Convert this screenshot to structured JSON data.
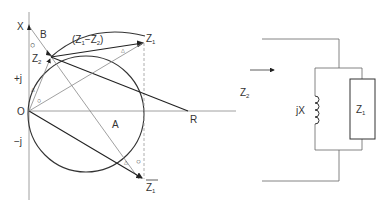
{
  "diagram": {
    "axes": {
      "vertical_label": "X",
      "positive_label": "+j",
      "negative_label": "−j",
      "origin_label": "O",
      "resistance_label": "R"
    },
    "points": {
      "z2": {
        "main": "Z",
        "sub": "2"
      },
      "z1": {
        "main": "Z",
        "sub": "1"
      },
      "z1_conjugate": {
        "main": "Z",
        "sub": "1",
        "overline": true
      },
      "b": "B",
      "a": "A"
    },
    "difference_label": {
      "open": "(Z",
      "sub1": "1",
      "minus": "−Z",
      "sub2": "2",
      "close": ")"
    },
    "angle_markers": {
      "circle": "○",
      "triangle": "△"
    },
    "circuit": {
      "input_label": {
        "main": "Z",
        "sub": "2"
      },
      "inductor_label": "jX",
      "load_label": {
        "main": "Z",
        "sub": "1"
      }
    },
    "colors": {
      "line": "#444444",
      "thin": "#888888",
      "dashed": "#999999"
    }
  }
}
